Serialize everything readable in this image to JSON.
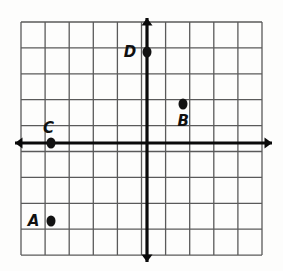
{
  "figure": {
    "background_color": "#fdfdfc"
  },
  "chart_data": {
    "type": "scatter",
    "title": "",
    "xlabel": "",
    "ylabel": "",
    "xlim": [
      -5,
      5
    ],
    "ylim": [
      -4,
      5
    ],
    "grid": true,
    "grid_spacing": 1,
    "grid_color": "#5a5a5a",
    "axis_color": "#0a0a0a",
    "point_color": "#121212",
    "legend": "none",
    "x_tick_labels": [],
    "y_tick_labels": [],
    "axes": {
      "x_axis": {
        "y": 0,
        "arrow_left": true,
        "arrow_right": true
      },
      "y_axis": {
        "x": 0,
        "arrow_up": true,
        "arrow_down": true
      }
    },
    "points": [
      {
        "label": "A",
        "x": -4,
        "y": -3,
        "label_position": "left"
      },
      {
        "label": "B",
        "x": 1.5,
        "y": 1.5,
        "label_position": "below"
      },
      {
        "label": "C",
        "x": -4,
        "y": 0,
        "label_position": "above"
      },
      {
        "label": "D",
        "x": 0,
        "y": 3.5,
        "label_position": "left"
      }
    ]
  },
  "geometry": {
    "grid_left": 21,
    "grid_top": 22,
    "grid_right": 262,
    "grid_bottom": 255,
    "cell_w": 24.1,
    "cell_h": 25.9,
    "origin_x": 147,
    "origin_y": 143,
    "cols": 10,
    "rows": 9,
    "x_axis_start": 15,
    "x_axis_end": 272,
    "y_axis_start": 18,
    "y_axis_end": 262
  }
}
